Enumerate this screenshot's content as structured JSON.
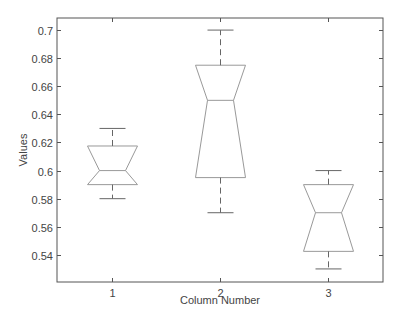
{
  "chart_data": {
    "type": "boxplot",
    "title": "",
    "xlabel": "Column Number",
    "ylabel": "Values",
    "categories": [
      "1",
      "2",
      "3"
    ],
    "ylim": [
      0.5207,
      0.7086
    ],
    "yticks": [
      0.54,
      0.56,
      0.58,
      0.6,
      0.62,
      0.64,
      0.66,
      0.68,
      0.7
    ],
    "ytick_labels": [
      "0.54",
      "0.56",
      "0.58",
      "0.6",
      "0.62",
      "0.64",
      "0.66",
      "0.68",
      "0.7"
    ],
    "notched": true,
    "grid": false,
    "legend": null,
    "boxes": [
      {
        "label": "1",
        "whisker_low": 0.58,
        "q1": 0.59,
        "median": 0.6,
        "q3": 0.6175,
        "whisker_high": 0.63
      },
      {
        "label": "2",
        "whisker_low": 0.57,
        "q1": 0.595,
        "median": 0.65,
        "q3": 0.675,
        "whisker_high": 0.7
      },
      {
        "label": "3",
        "whisker_low": 0.53,
        "q1": 0.5425,
        "median": 0.57,
        "q3": 0.59,
        "whisker_high": 0.6
      }
    ]
  },
  "colors": {
    "box": "#999999",
    "whisker": "#666666",
    "axis": "#555555",
    "text": "#444444"
  }
}
